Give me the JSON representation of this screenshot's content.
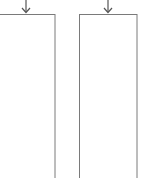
{
  "diagram": {
    "stroke_color": "#7a7a7a",
    "boxes": [
      {
        "id": "box-left",
        "x": -1,
        "y": 14,
        "width": 56,
        "height": 170
      },
      {
        "id": "box-right",
        "x": 79,
        "y": 14,
        "width": 58,
        "height": 170
      }
    ],
    "arrows": [
      {
        "id": "arrow-left",
        "x": 26,
        "y1": 0,
        "y2": 13
      },
      {
        "id": "arrow-right",
        "x": 108,
        "y1": 0,
        "y2": 13
      }
    ]
  }
}
